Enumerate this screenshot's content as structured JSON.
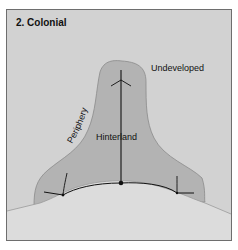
{
  "diagram": {
    "title": "2. Colonial",
    "labels": {
      "undeveloped": "Undeveloped",
      "periphery": "Periphery",
      "hinterland": "Hinterland"
    },
    "colors": {
      "frame_border": "#6e6e6e",
      "land_background": "#d2d2d2",
      "sea": "#dcdcdc",
      "developed_region": "#b3b3b3",
      "region_outline": "#8a8a8a",
      "routes": "#111111",
      "coastline": "#9a9a9a"
    }
  }
}
